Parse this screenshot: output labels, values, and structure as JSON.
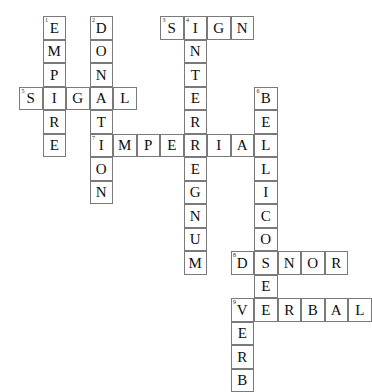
{
  "puzzle": {
    "title": "Crossword Grid",
    "grid": {
      "cell_size": 23.5,
      "origin_x": 19,
      "origin_y": 16,
      "columns": 15,
      "rows": 16,
      "border_color": "#7a7a7a",
      "cell_background": "#ffffff",
      "letter_color": "#0d0d0d",
      "clue_number_color": "#2a2a2a",
      "page_background": "#ffffff"
    },
    "entries": [
      {
        "number": "1",
        "answer": "EMPIRE",
        "direction": "down",
        "row": 0,
        "col": 1
      },
      {
        "number": "2",
        "answer": "DONATION",
        "direction": "down",
        "row": 0,
        "col": 3
      },
      {
        "number": "3",
        "answer": "SIGN",
        "direction": "across",
        "row": 0,
        "col": 6
      },
      {
        "number": "4",
        "answer": "INTERREGNUM",
        "direction": "down",
        "row": 0,
        "col": 7
      },
      {
        "number": "5",
        "answer": "SIGNAL",
        "direction": "across",
        "row": 3,
        "col": 0
      },
      {
        "number": "6",
        "answer": "BELLICOSE",
        "direction": "down",
        "row": 3,
        "col": 10
      },
      {
        "number": "7",
        "answer": "IMPERIAL",
        "direction": "across",
        "row": 5,
        "col": 3
      },
      {
        "number": "8",
        "answer": "DONOR",
        "direction": "across",
        "row": 10,
        "col": 9
      },
      {
        "number": "9",
        "answer": "VERBAL",
        "direction": "across",
        "row": 12,
        "col": 9
      },
      {
        "number": "9",
        "answer": "VERB",
        "direction": "down",
        "row": 12,
        "col": 9
      }
    ],
    "cells": [
      {
        "row": 0,
        "col": 1,
        "letter": "E",
        "number": "1"
      },
      {
        "row": 1,
        "col": 1,
        "letter": "M",
        "number": ""
      },
      {
        "row": 2,
        "col": 1,
        "letter": "P",
        "number": ""
      },
      {
        "row": 3,
        "col": 1,
        "letter": "I",
        "number": ""
      },
      {
        "row": 4,
        "col": 1,
        "letter": "R",
        "number": ""
      },
      {
        "row": 5,
        "col": 1,
        "letter": "E",
        "number": ""
      },
      {
        "row": 0,
        "col": 3,
        "letter": "D",
        "number": "2"
      },
      {
        "row": 1,
        "col": 3,
        "letter": "O",
        "number": ""
      },
      {
        "row": 2,
        "col": 3,
        "letter": "N",
        "number": ""
      },
      {
        "row": 3,
        "col": 3,
        "letter": "A",
        "number": ""
      },
      {
        "row": 4,
        "col": 3,
        "letter": "T",
        "number": ""
      },
      {
        "row": 5,
        "col": 3,
        "letter": "I",
        "number": "7"
      },
      {
        "row": 6,
        "col": 3,
        "letter": "O",
        "number": ""
      },
      {
        "row": 7,
        "col": 3,
        "letter": "N",
        "number": ""
      },
      {
        "row": 0,
        "col": 6,
        "letter": "S",
        "number": "3"
      },
      {
        "row": 0,
        "col": 7,
        "letter": "I",
        "number": "4"
      },
      {
        "row": 0,
        "col": 8,
        "letter": "G",
        "number": ""
      },
      {
        "row": 0,
        "col": 9,
        "letter": "N",
        "number": ""
      },
      {
        "row": 1,
        "col": 7,
        "letter": "N",
        "number": ""
      },
      {
        "row": 2,
        "col": 7,
        "letter": "T",
        "number": ""
      },
      {
        "row": 3,
        "col": 7,
        "letter": "E",
        "number": ""
      },
      {
        "row": 4,
        "col": 7,
        "letter": "R",
        "number": ""
      },
      {
        "row": 5,
        "col": 7,
        "letter": "R",
        "number": ""
      },
      {
        "row": 6,
        "col": 7,
        "letter": "E",
        "number": ""
      },
      {
        "row": 7,
        "col": 7,
        "letter": "G",
        "number": ""
      },
      {
        "row": 8,
        "col": 7,
        "letter": "N",
        "number": ""
      },
      {
        "row": 9,
        "col": 7,
        "letter": "U",
        "number": ""
      },
      {
        "row": 10,
        "col": 7,
        "letter": "M",
        "number": ""
      },
      {
        "row": 3,
        "col": 0,
        "letter": "S",
        "number": "5"
      },
      {
        "row": 3,
        "col": 2,
        "letter": "G",
        "number": ""
      },
      {
        "row": 3,
        "col": 4,
        "letter": "L",
        "number": ""
      },
      {
        "row": 3,
        "col": 10,
        "letter": "B",
        "number": "6"
      },
      {
        "row": 4,
        "col": 10,
        "letter": "E",
        "number": ""
      },
      {
        "row": 5,
        "col": 10,
        "letter": "L",
        "number": ""
      },
      {
        "row": 6,
        "col": 10,
        "letter": "L",
        "number": ""
      },
      {
        "row": 7,
        "col": 10,
        "letter": "I",
        "number": ""
      },
      {
        "row": 8,
        "col": 10,
        "letter": "C",
        "number": ""
      },
      {
        "row": 9,
        "col": 10,
        "letter": "O",
        "number": ""
      },
      {
        "row": 10,
        "col": 10,
        "letter": "S",
        "number": ""
      },
      {
        "row": 11,
        "col": 10,
        "letter": "E",
        "number": ""
      },
      {
        "row": 5,
        "col": 4,
        "letter": "M",
        "number": ""
      },
      {
        "row": 5,
        "col": 5,
        "letter": "P",
        "number": ""
      },
      {
        "row": 5,
        "col": 6,
        "letter": "E",
        "number": ""
      },
      {
        "row": 5,
        "col": 8,
        "letter": "I",
        "number": ""
      },
      {
        "row": 5,
        "col": 9,
        "letter": "A",
        "number": ""
      },
      {
        "row": 10,
        "col": 9,
        "letter": "D",
        "number": "8"
      },
      {
        "row": 10,
        "col": 11,
        "letter": "N",
        "number": ""
      },
      {
        "row": 10,
        "col": 12,
        "letter": "O",
        "number": ""
      },
      {
        "row": 10,
        "col": 13,
        "letter": "R",
        "number": ""
      },
      {
        "row": 12,
        "col": 9,
        "letter": "V",
        "number": "9"
      },
      {
        "row": 12,
        "col": 10,
        "letter": "E",
        "number": ""
      },
      {
        "row": 12,
        "col": 11,
        "letter": "R",
        "number": ""
      },
      {
        "row": 12,
        "col": 12,
        "letter": "B",
        "number": ""
      },
      {
        "row": 12,
        "col": 13,
        "letter": "A",
        "number": ""
      },
      {
        "row": 12,
        "col": 14,
        "letter": "L",
        "number": ""
      },
      {
        "row": 13,
        "col": 9,
        "letter": "E",
        "number": ""
      },
      {
        "row": 14,
        "col": 9,
        "letter": "R",
        "number": ""
      },
      {
        "row": 15,
        "col": 9,
        "letter": "B",
        "number": ""
      }
    ]
  }
}
